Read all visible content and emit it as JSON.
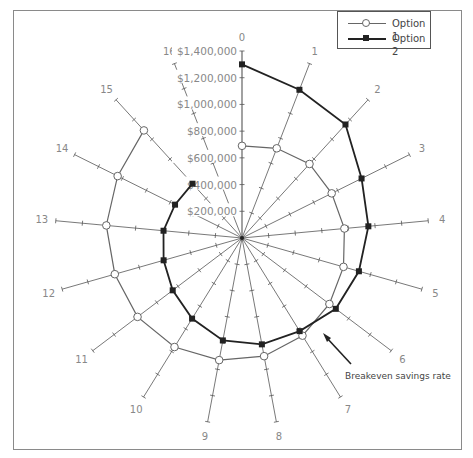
{
  "chart_data": {
    "type": "radar",
    "title": "",
    "categories": [
      "0",
      "1",
      "2",
      "3",
      "4",
      "5",
      "6",
      "7",
      "8",
      "9",
      "10",
      "11",
      "12",
      "13",
      "14",
      "15",
      "16"
    ],
    "radial_axis": {
      "min": 0,
      "max": 1400000,
      "step": 200000,
      "tick_labels": [
        "$200,000",
        "$400,000",
        "$600,000",
        "$800,000",
        "$1,000,000",
        "$1,200,000",
        "$1,400,000"
      ]
    },
    "series": [
      {
        "name": "Option 1",
        "marker": "open-circle",
        "color": "#666666",
        "values": [
          690000,
          720000,
          750000,
          750000,
          770000,
          790000,
          820000,
          860000,
          900000,
          930000,
          960000,
          980000,
          990000,
          1020000,
          1040000,
          1090000,
          null
        ]
      },
      {
        "name": "Option 2",
        "marker": "filled-square",
        "color": "#222222",
        "values": [
          1300000,
          1190000,
          1150000,
          1000000,
          950000,
          910000,
          880000,
          820000,
          810000,
          780000,
          710000,
          650000,
          610000,
          590000,
          560000,
          550000,
          null
        ]
      }
    ],
    "annotations": [
      {
        "text": "Breakeven savings rate",
        "points_to_axis": "7"
      }
    ],
    "legend": {
      "position": "top-right",
      "entries": [
        "Option 1",
        "Option 2"
      ]
    },
    "grid": false
  },
  "legend": {
    "option1_label": "Option 1",
    "option2_label": "Option 2"
  },
  "annotation_text": "Breakeven savings rate"
}
